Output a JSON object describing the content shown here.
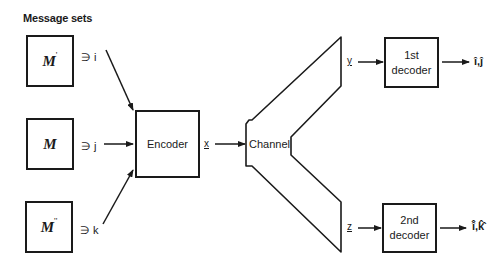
{
  "heading": "Message sets",
  "message_sets": [
    {
      "symbol": "M",
      "prime": "'",
      "member_symbol": "∋",
      "member": "i"
    },
    {
      "symbol": "M",
      "prime": "",
      "member_symbol": "∋",
      "member": "j"
    },
    {
      "symbol": "M",
      "prime": "''",
      "member_symbol": "∋",
      "member": "k"
    }
  ],
  "encoder": {
    "label": "Encoder",
    "output": "x"
  },
  "channel": {
    "label": "Channel",
    "output_top": "y",
    "output_bottom": "z"
  },
  "decoders": [
    {
      "line1": "1st",
      "line2": "decoder",
      "output": "î,ĵ"
    },
    {
      "line1": "2nd",
      "line2": "decoder",
      "output": "î̂,k̂̂"
    }
  ],
  "colors": {
    "stroke": "#1a1a1a",
    "background": "#ffffff"
  }
}
